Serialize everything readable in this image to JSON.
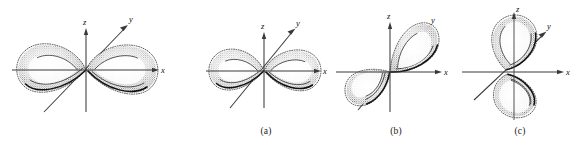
{
  "figure": {
    "background_color": "#ffffff",
    "ink_color": "#000000",
    "axis_color": "#3a3a3a",
    "panel_count": 4
  },
  "panels": [
    {
      "id": "panel-0",
      "caption": "",
      "orbital_label": "",
      "orientation": "two lobes along x axis, z vertical, y to upper-right",
      "lobe_count": 2,
      "axes": [
        {
          "name": "x",
          "label": "x",
          "direction": "right",
          "arrow": true
        },
        {
          "name": "z",
          "label": "z",
          "direction": "up",
          "arrow": true
        },
        {
          "name": "y",
          "label": "y",
          "direction": "upper-right-diagonal",
          "arrow": true
        }
      ]
    },
    {
      "id": "panel-a",
      "caption": "(a)",
      "orbital_label": "(a)",
      "orientation": "two lobes along x axis, z vertical, y to upper-right",
      "lobe_count": 2,
      "axes": [
        {
          "name": "x",
          "label": "x",
          "direction": "right",
          "arrow": true
        },
        {
          "name": "z",
          "label": "z",
          "direction": "up",
          "arrow": true
        },
        {
          "name": "y",
          "label": "y",
          "direction": "upper-right-diagonal",
          "arrow": true
        }
      ]
    },
    {
      "id": "panel-b",
      "caption": "(b)",
      "orbital_label": "(b)",
      "orientation": "two lobes along y axis (upper-right and lower-left), z vertical, x right",
      "lobe_count": 2,
      "axes": [
        {
          "name": "x",
          "label": "x",
          "direction": "right",
          "arrow": true
        },
        {
          "name": "z",
          "label": "z",
          "direction": "up",
          "arrow": true
        },
        {
          "name": "y",
          "label": "y",
          "direction": "upper-right-diagonal",
          "arrow": true
        }
      ]
    },
    {
      "id": "panel-c",
      "caption": "(c)",
      "orbital_label": "(c)",
      "orientation": "two lobes along z axis (up and down), x right, y to upper-right",
      "lobe_count": 2,
      "axes": [
        {
          "name": "x",
          "label": "x",
          "direction": "right",
          "arrow": true
        },
        {
          "name": "z",
          "label": "z",
          "direction": "up",
          "arrow": true
        },
        {
          "name": "y",
          "label": "y",
          "direction": "upper-right-diagonal",
          "arrow": true
        }
      ]
    }
  ],
  "axis_labels": {
    "x": "x",
    "y": "y",
    "z": "z"
  },
  "captions": {
    "a": "(a)",
    "b": "(b)",
    "c": "(c)"
  }
}
